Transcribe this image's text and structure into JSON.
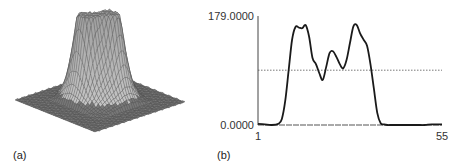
{
  "panels": {
    "a": {
      "label": "(a)",
      "description": "3D wireframe surface plot of intensity profile with two prominent peaks"
    },
    "b": {
      "label": "(b)"
    }
  },
  "chart_data": {
    "type": "line",
    "title": "",
    "xlabel": "",
    "ylabel": "",
    "x_tick_labels": [
      "1",
      "55"
    ],
    "y_tick_labels": [
      "0.0000",
      "179.0000"
    ],
    "xlim": [
      1,
      55
    ],
    "ylim": [
      0,
      179
    ],
    "grid": false,
    "legend": null,
    "threshold": {
      "value": 90,
      "style": "dotted"
    },
    "series": [
      {
        "name": "profile",
        "x": [
          1,
          3,
          5,
          7,
          8,
          9,
          10,
          11,
          12,
          13,
          14,
          15,
          16,
          17,
          18,
          19,
          20,
          21,
          22,
          23,
          24,
          25,
          26,
          27,
          28,
          29,
          30,
          31,
          32,
          33,
          34,
          35,
          36,
          37,
          38,
          39,
          40,
          41,
          42,
          43,
          44,
          45,
          46,
          47,
          48,
          50,
          52,
          55
        ],
        "values": [
          2,
          1,
          0,
          2,
          10,
          40,
          90,
          140,
          161,
          160,
          159,
          164,
          145,
          110,
          100,
          85,
          74,
          95,
          118,
          121,
          112,
          100,
          93,
          107,
          135,
          162,
          164,
          150,
          140,
          130,
          100,
          60,
          20,
          3,
          1,
          0,
          0,
          0,
          0,
          0,
          0,
          0,
          0,
          0,
          0,
          0,
          1,
          1
        ]
      }
    ]
  }
}
